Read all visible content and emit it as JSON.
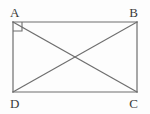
{
  "figure": {
    "name": "rectangle-with-diagonals",
    "shape_type": "rectangle",
    "background_color": "#fdfdfd",
    "stroke_color": "#6e6e6e",
    "label_color": "#3a3a3a",
    "stroke_width": 1.2,
    "rectangle": {
      "left": 13,
      "top": 22,
      "right": 137,
      "bottom": 92,
      "width": 124,
      "height": 70
    },
    "vertices": [
      {
        "id": "A",
        "label": "A",
        "x": 13,
        "y": 22,
        "position": "top-left",
        "label_x": 10,
        "label_y": 17
      },
      {
        "id": "B",
        "label": "B",
        "x": 137,
        "y": 22,
        "position": "top-right",
        "label_x": 131,
        "label_y": 17
      },
      {
        "id": "C",
        "label": "C",
        "x": 137,
        "y": 92,
        "position": "bottom-right",
        "label_x": 131,
        "label_y": 108
      },
      {
        "id": "D",
        "label": "D",
        "x": 13,
        "y": 92,
        "position": "bottom-left",
        "label_x": 10,
        "label_y": 108
      }
    ],
    "sides": [
      {
        "id": "AB",
        "from": "A",
        "to": "B"
      },
      {
        "id": "BC",
        "from": "B",
        "to": "C"
      },
      {
        "id": "CD",
        "from": "C",
        "to": "D"
      },
      {
        "id": "DA",
        "from": "D",
        "to": "A"
      }
    ],
    "diagonals": [
      {
        "id": "AC",
        "from": "A",
        "to": "C",
        "x1": 13,
        "y1": 22,
        "x2": 137,
        "y2": 92
      },
      {
        "id": "BD",
        "from": "B",
        "to": "D",
        "x1": 137,
        "y1": 22,
        "x2": 13,
        "y2": 92
      }
    ],
    "diagonal_intersection": {
      "x": 75,
      "y": 57
    },
    "right_angle_marker": {
      "at_vertex": "A",
      "size": 9,
      "x": 13,
      "y": 22
    }
  }
}
